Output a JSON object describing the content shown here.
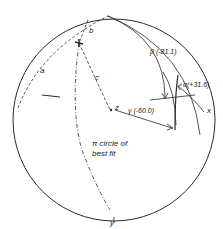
{
  "diagram": {
    "type": "stereographic-projection",
    "labels": {
      "a": "a",
      "b": "b",
      "c": "c",
      "z": "z",
      "x": "x",
      "y": "y",
      "beta": "β (-81.1)",
      "gamma": "γ (-60.0)",
      "alpha": "α(+31.6)",
      "pi_line1": "π circle of",
      "pi_line2": "best fit"
    },
    "colors": {
      "ink": "#2a2a2a",
      "background": "#ffffff"
    }
  }
}
